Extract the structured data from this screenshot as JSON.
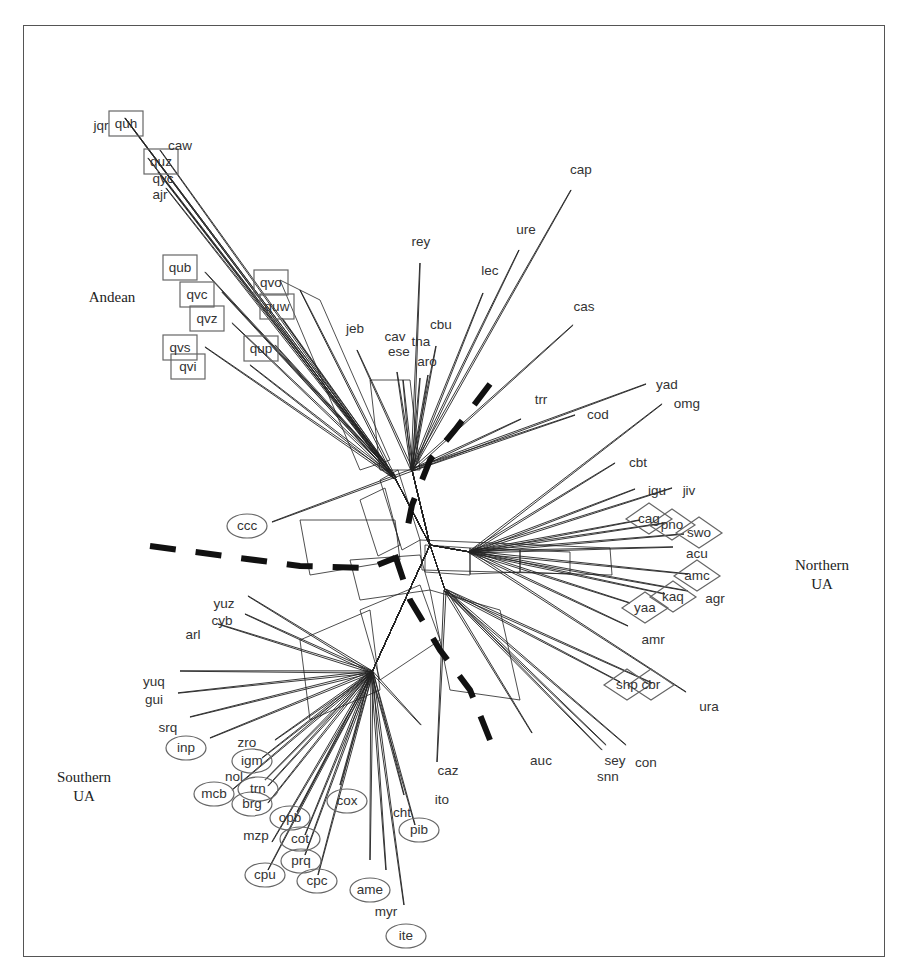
{
  "figure": {
    "type": "splits-network",
    "frame": {
      "x": 23,
      "y": 25,
      "width": 862,
      "height": 932
    },
    "hub": {
      "x": 430,
      "y": 545
    },
    "group_labels": [
      {
        "id": "andean",
        "lines": [
          "Andean"
        ],
        "x": 112,
        "y": 302
      },
      {
        "id": "northern-ua",
        "lines": [
          "Northern",
          "UA"
        ],
        "x": 822,
        "y": 570
      },
      {
        "id": "southern-ua",
        "lines": [
          "Southern",
          "UA"
        ],
        "x": 84,
        "y": 782
      }
    ],
    "legend_shapes": {
      "box": "Andean",
      "diamond": "Northern UA",
      "ellipse": "Southern UA",
      "none": "unassigned"
    },
    "boundaries": [
      {
        "id": "boundary-west",
        "points": [
          [
            150,
            546
          ],
          [
            300,
            566
          ],
          [
            370,
            568
          ],
          [
            395,
            558
          ]
        ]
      },
      {
        "id": "boundary-north",
        "points": [
          [
            490,
            384
          ],
          [
            455,
            430
          ],
          [
            430,
            460
          ],
          [
            412,
            505
          ],
          [
            405,
            540
          ]
        ]
      },
      {
        "id": "boundary-south",
        "points": [
          [
            395,
            555
          ],
          [
            410,
            600
          ],
          [
            440,
            650
          ],
          [
            470,
            690
          ],
          [
            490,
            740
          ]
        ]
      }
    ],
    "leaves": [
      {
        "label": "jqr",
        "shape": "none",
        "lx": 101,
        "ly": 125,
        "ex": 125,
        "ey": 118
      },
      {
        "label": "quh",
        "shape": "box",
        "lx": 126,
        "ly": 123,
        "ex": 125,
        "ey": 118
      },
      {
        "label": "caw",
        "shape": "none",
        "lx": 180,
        "ly": 145,
        "ex": 160,
        "ey": 150
      },
      {
        "label": "quz",
        "shape": "box",
        "lx": 161,
        "ly": 161,
        "ex": 148,
        "ey": 158
      },
      {
        "label": "qyc",
        "shape": "none",
        "lx": 163,
        "ly": 178,
        "ex": 158,
        "ey": 172
      },
      {
        "label": "ajr",
        "shape": "none",
        "lx": 160,
        "ly": 194,
        "ex": 166,
        "ey": 188
      },
      {
        "label": "qub",
        "shape": "box",
        "lx": 180,
        "ly": 267,
        "ex": 205,
        "ey": 272
      },
      {
        "label": "qvc",
        "shape": "box",
        "lx": 197,
        "ly": 294,
        "ex": 222,
        "ey": 292
      },
      {
        "label": "qvz",
        "shape": "box",
        "lx": 207,
        "ly": 318,
        "ex": 232,
        "ey": 323
      },
      {
        "label": "qvs",
        "shape": "box",
        "lx": 180,
        "ly": 347,
        "ex": 205,
        "ey": 347
      },
      {
        "label": "qvi",
        "shape": "box",
        "lx": 188,
        "ly": 366,
        "ex": 250,
        "ey": 365
      },
      {
        "label": "qvo",
        "shape": "box",
        "lx": 271,
        "ly": 282,
        "ex": 300,
        "ey": 290
      },
      {
        "label": "quw",
        "shape": "box",
        "lx": 277,
        "ly": 306,
        "ex": 282,
        "ey": 318
      },
      {
        "label": "qup",
        "shape": "box",
        "lx": 261,
        "ly": 348,
        "ex": 275,
        "ey": 345
      },
      {
        "label": "rey",
        "shape": "none",
        "lx": 421,
        "ly": 241,
        "ex": 420,
        "ey": 263
      },
      {
        "label": "jeb",
        "shape": "none",
        "lx": 355,
        "ly": 328,
        "ex": 357,
        "ey": 350
      },
      {
        "label": "cav",
        "shape": "none",
        "lx": 395,
        "ly": 336,
        "ex": 397,
        "ey": 372
      },
      {
        "label": "ese",
        "shape": "none",
        "lx": 399,
        "ly": 351,
        "ex": 403,
        "ey": 380
      },
      {
        "label": "tna",
        "shape": "none",
        "lx": 421,
        "ly": 341,
        "ex": 420,
        "ey": 378
      },
      {
        "label": "cbu",
        "shape": "none",
        "lx": 441,
        "ly": 324,
        "ex": 436,
        "ey": 346
      },
      {
        "label": "aro",
        "shape": "none",
        "lx": 427,
        "ly": 361,
        "ex": 428,
        "ey": 375
      },
      {
        "label": "lec",
        "shape": "none",
        "lx": 490,
        "ly": 270,
        "ex": 483,
        "ey": 293
      },
      {
        "label": "ure",
        "shape": "none",
        "lx": 526,
        "ly": 229,
        "ex": 519,
        "ey": 250
      },
      {
        "label": "cap",
        "shape": "none",
        "lx": 581,
        "ly": 169,
        "ex": 571,
        "ey": 190
      },
      {
        "label": "cas",
        "shape": "none",
        "lx": 584,
        "ly": 306,
        "ex": 573,
        "ey": 325
      },
      {
        "label": "trr",
        "shape": "none",
        "lx": 541,
        "ly": 399,
        "ex": 521,
        "ey": 419
      },
      {
        "label": "cod",
        "shape": "none",
        "lx": 598,
        "ly": 414,
        "ex": 575,
        "ey": 415
      },
      {
        "label": "yad",
        "shape": "none",
        "lx": 667,
        "ly": 384,
        "ex": 646,
        "ey": 384
      },
      {
        "label": "omg",
        "shape": "none",
        "lx": 687,
        "ly": 403,
        "ex": 662,
        "ey": 404
      },
      {
        "label": "cbt",
        "shape": "none",
        "lx": 638,
        "ly": 462,
        "ex": 615,
        "ey": 463
      },
      {
        "label": "igu",
        "shape": "none",
        "lx": 657,
        "ly": 490,
        "ex": 635,
        "ey": 489
      },
      {
        "label": "jiv",
        "shape": "none",
        "lx": 689,
        "ly": 490,
        "ex": 672,
        "ey": 488
      },
      {
        "label": "cag",
        "shape": "diamond",
        "lx": 649,
        "ly": 518,
        "ex": 640,
        "ey": 520
      },
      {
        "label": "pno",
        "shape": "diamond",
        "lx": 672,
        "ly": 524,
        "ex": 665,
        "ey": 523
      },
      {
        "label": "swo",
        "shape": "diamond",
        "lx": 699,
        "ly": 532,
        "ex": 684,
        "ey": 534
      },
      {
        "label": "acu",
        "shape": "none",
        "lx": 697,
        "ly": 553,
        "ex": 673,
        "ey": 547
      },
      {
        "label": "amc",
        "shape": "diamond",
        "lx": 697,
        "ly": 575,
        "ex": 688,
        "ey": 574
      },
      {
        "label": "agr",
        "shape": "none",
        "lx": 715,
        "ly": 598,
        "ex": 688,
        "ey": 591
      },
      {
        "label": "kaq",
        "shape": "diamond",
        "lx": 673,
        "ly": 596,
        "ex": 665,
        "ey": 594
      },
      {
        "label": "yaa",
        "shape": "diamond",
        "lx": 645,
        "ly": 607,
        "ex": 630,
        "ey": 603
      },
      {
        "label": "amr",
        "shape": "none",
        "lx": 653,
        "ly": 639,
        "ex": 628,
        "ey": 626
      },
      {
        "label": "shp",
        "shape": "diamond",
        "lx": 627,
        "ly": 684,
        "ex": 620,
        "ey": 682
      },
      {
        "label": "cbr",
        "shape": "diamond",
        "lx": 651,
        "ly": 684,
        "ex": 652,
        "ey": 683
      },
      {
        "label": "ura",
        "shape": "none",
        "lx": 709,
        "ly": 706,
        "ex": 686,
        "ey": 692
      },
      {
        "label": "sey",
        "shape": "none",
        "lx": 615,
        "ly": 760,
        "ex": 606,
        "ey": 745
      },
      {
        "label": "con",
        "shape": "none",
        "lx": 646,
        "ly": 762,
        "ex": 626,
        "ey": 745
      },
      {
        "label": "snn",
        "shape": "none",
        "lx": 608,
        "ly": 776,
        "ex": 602,
        "ey": 750
      },
      {
        "label": "auc",
        "shape": "none",
        "lx": 541,
        "ly": 760,
        "ex": 532,
        "ey": 733
      },
      {
        "label": "caz",
        "shape": "none",
        "lx": 448,
        "ly": 770,
        "ex": 437,
        "ey": 762
      },
      {
        "label": "ito",
        "shape": "none",
        "lx": 442,
        "ly": 799,
        "ex": 421,
        "ey": 725
      },
      {
        "label": "cht",
        "shape": "none",
        "lx": 402,
        "ly": 812,
        "ex": 404,
        "ey": 795
      },
      {
        "label": "pib",
        "shape": "ellipse",
        "lx": 419,
        "ly": 829,
        "ex": 415,
        "ey": 825
      },
      {
        "label": "cox",
        "shape": "ellipse",
        "lx": 347,
        "ly": 800,
        "ex": 340,
        "ey": 785
      },
      {
        "label": "ame",
        "shape": "ellipse",
        "lx": 370,
        "ly": 889,
        "ex": 370,
        "ey": 860
      },
      {
        "label": "myr",
        "shape": "none",
        "lx": 386,
        "ly": 911,
        "ex": 386,
        "ey": 870
      },
      {
        "label": "ite",
        "shape": "ellipse",
        "lx": 406,
        "ly": 935,
        "ex": 404,
        "ey": 905
      },
      {
        "label": "ccc",
        "shape": "ellipse",
        "lx": 247,
        "ly": 525,
        "ex": 272,
        "ey": 522
      },
      {
        "label": "yuz",
        "shape": "none",
        "lx": 224,
        "ly": 603,
        "ex": 248,
        "ey": 596
      },
      {
        "label": "cyb",
        "shape": "none",
        "lx": 222,
        "ly": 620,
        "ex": 245,
        "ey": 614
      },
      {
        "label": "arl",
        "shape": "none",
        "lx": 193,
        "ly": 634,
        "ex": 218,
        "ey": 624
      },
      {
        "label": "yuq",
        "shape": "none",
        "lx": 154,
        "ly": 681,
        "ex": 180,
        "ey": 671
      },
      {
        "label": "gui",
        "shape": "none",
        "lx": 154,
        "ly": 699,
        "ex": 178,
        "ey": 693
      },
      {
        "label": "srq",
        "shape": "none",
        "lx": 168,
        "ly": 727,
        "ex": 190,
        "ey": 717
      },
      {
        "label": "inp",
        "shape": "ellipse",
        "lx": 186,
        "ly": 747,
        "ex": 210,
        "ey": 738
      },
      {
        "label": "zro",
        "shape": "none",
        "lx": 247,
        "ly": 742,
        "ex": 275,
        "ey": 740
      },
      {
        "label": "igm",
        "shape": "ellipse",
        "lx": 252,
        "ly": 760,
        "ex": 262,
        "ey": 758
      },
      {
        "label": "nol",
        "shape": "none",
        "lx": 234,
        "ly": 776,
        "ex": 265,
        "ey": 780
      },
      {
        "label": "mcb",
        "shape": "ellipse",
        "lx": 214,
        "ly": 793,
        "ex": 232,
        "ey": 790
      },
      {
        "label": "trn",
        "shape": "ellipse",
        "lx": 258,
        "ly": 788,
        "ex": 268,
        "ey": 786
      },
      {
        "label": "brg",
        "shape": "ellipse",
        "lx": 252,
        "ly": 803,
        "ex": 268,
        "ey": 803
      },
      {
        "label": "opb",
        "shape": "ellipse",
        "lx": 290,
        "ly": 817,
        "ex": 297,
        "ey": 812
      },
      {
        "label": "mzp",
        "shape": "none",
        "lx": 256,
        "ly": 835,
        "ex": 272,
        "ey": 842
      },
      {
        "label": "cot",
        "shape": "ellipse",
        "lx": 300,
        "ly": 838,
        "ex": 305,
        "ey": 835
      },
      {
        "label": "prq",
        "shape": "ellipse",
        "lx": 301,
        "ly": 860,
        "ex": 305,
        "ey": 855
      },
      {
        "label": "cpu",
        "shape": "ellipse",
        "lx": 265,
        "ly": 874,
        "ex": 268,
        "ey": 870
      },
      {
        "label": "cpc",
        "shape": "ellipse",
        "lx": 317,
        "ly": 880,
        "ex": 318,
        "ey": 875
      }
    ]
  }
}
